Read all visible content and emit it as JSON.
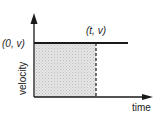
{
  "diagram": {
    "title": "",
    "axes": {
      "x_label": "time",
      "y_label": "velocity"
    },
    "points": {
      "start": "(0, v)",
      "end": "(t, v)"
    },
    "shaded_region": "area under constant velocity from 0 to t",
    "colors": {
      "line": "#1a1a1a",
      "shade": "#d9d9d9",
      "background": "#ffffff"
    }
  }
}
